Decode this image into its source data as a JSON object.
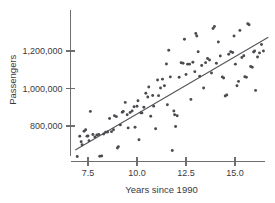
{
  "chart_data": {
    "type": "scatter",
    "title": "",
    "subtitle": "",
    "xlabel": "Years since 1990",
    "ylabel": "Passengers",
    "xlim": [
      6.8,
      16.8
    ],
    "ylim": [
      620000,
      1400000
    ],
    "grid": false,
    "legend": null,
    "xticks": [
      7.5,
      10.0,
      12.5,
      15.0
    ],
    "xtick_labels": [
      "7.5",
      "10.0",
      "12.5",
      "15.0"
    ],
    "yticks": [
      800000,
      1000000,
      1200000
    ],
    "ytick_labels": [
      "800,000",
      "1,000,000",
      "1,200,000"
    ],
    "point_color": "#4a4a50",
    "line_color": "#55555a",
    "axis_color": "#6f6f72",
    "trend_line": {
      "x_start": 6.85,
      "y_start": 672000,
      "x_end": 16.7,
      "y_end": 1273000
    },
    "series": [
      {
        "name": "Passengers",
        "points": [
          [
            6.95,
            637000
          ],
          [
            7.08,
            745000
          ],
          [
            7.15,
            716000
          ],
          [
            7.2,
            700000
          ],
          [
            7.3,
            772000
          ],
          [
            7.38,
            780000
          ],
          [
            7.45,
            746000
          ],
          [
            7.5,
            747000
          ],
          [
            7.55,
            722000
          ],
          [
            7.62,
            878000
          ],
          [
            7.75,
            755000
          ],
          [
            7.85,
            742000
          ],
          [
            7.95,
            752000
          ],
          [
            8.05,
            755000
          ],
          [
            8.1,
            639000
          ],
          [
            8.2,
            640000
          ],
          [
            8.3,
            757000
          ],
          [
            8.4,
            767000
          ],
          [
            8.5,
            768000
          ],
          [
            8.6,
            840000
          ],
          [
            8.7,
            770000
          ],
          [
            8.8,
            780000
          ],
          [
            8.85,
            855000
          ],
          [
            8.95,
            850000
          ],
          [
            9.0,
            683000
          ],
          [
            9.05,
            690000
          ],
          [
            9.15,
            806000
          ],
          [
            9.25,
            873000
          ],
          [
            9.3,
            878000
          ],
          [
            9.4,
            926000
          ],
          [
            9.5,
            860000
          ],
          [
            9.55,
            790000
          ],
          [
            9.65,
            872000
          ],
          [
            9.75,
            880000
          ],
          [
            9.85,
            903000
          ],
          [
            9.9,
            793000
          ],
          [
            10.0,
            905000
          ],
          [
            10.05,
            935000
          ],
          [
            10.1,
            727000
          ],
          [
            10.2,
            870000
          ],
          [
            10.25,
            870000
          ],
          [
            10.35,
            900000
          ],
          [
            10.45,
            975000
          ],
          [
            10.55,
            955000
          ],
          [
            10.6,
            1008000
          ],
          [
            10.7,
            852000
          ],
          [
            10.8,
            963000
          ],
          [
            10.85,
            906000
          ],
          [
            10.95,
            785000
          ],
          [
            11.05,
            1045000
          ],
          [
            11.1,
            962000
          ],
          [
            11.2,
            1003000
          ],
          [
            11.3,
            1050000
          ],
          [
            11.4,
            1015000
          ],
          [
            11.5,
            1131000
          ],
          [
            11.55,
            913000
          ],
          [
            11.62,
            1204000
          ],
          [
            11.7,
            1062000
          ],
          [
            11.8,
            669000
          ],
          [
            11.88,
            880000
          ],
          [
            11.92,
            860000
          ],
          [
            11.97,
            797000
          ],
          [
            12.05,
            855000
          ],
          [
            12.15,
            1060000
          ],
          [
            12.25,
            1137000
          ],
          [
            12.35,
            1135000
          ],
          [
            12.42,
            1263000
          ],
          [
            12.5,
            1075000
          ],
          [
            12.58,
            1130000
          ],
          [
            12.68,
            1130000
          ],
          [
            12.75,
            942000
          ],
          [
            12.85,
            1140000
          ],
          [
            12.95,
            1090000
          ],
          [
            13.0,
            1293000
          ],
          [
            13.05,
            1280000
          ],
          [
            13.12,
            1196000
          ],
          [
            13.2,
            1065000
          ],
          [
            13.3,
            1123000
          ],
          [
            13.4,
            1003000
          ],
          [
            13.5,
            1138000
          ],
          [
            13.6,
            1160000
          ],
          [
            13.7,
            1152000
          ],
          [
            13.8,
            1083000
          ],
          [
            13.88,
            1320000
          ],
          [
            13.95,
            1331000
          ],
          [
            14.05,
            1135000
          ],
          [
            14.15,
            1248000
          ],
          [
            14.25,
            1173000
          ],
          [
            14.35,
            1062000
          ],
          [
            14.42,
            1056000
          ],
          [
            14.5,
            960000
          ],
          [
            14.58,
            965000
          ],
          [
            14.68,
            1183000
          ],
          [
            14.78,
            1196000
          ],
          [
            14.88,
            1192000
          ],
          [
            14.95,
            1280000
          ],
          [
            15.02,
            1130000
          ],
          [
            15.1,
            1015000
          ],
          [
            15.18,
            1038000
          ],
          [
            15.25,
            1310000
          ],
          [
            15.35,
            1165000
          ],
          [
            15.45,
            1175000
          ],
          [
            15.5,
            1063000
          ],
          [
            15.58,
            1060000
          ],
          [
            15.65,
            1345000
          ],
          [
            15.72,
            1340000
          ],
          [
            15.8,
            1117000
          ],
          [
            15.88,
            1113000
          ],
          [
            15.95,
            1195000
          ],
          [
            16.0,
            1200000
          ],
          [
            16.05,
            990000
          ],
          [
            16.15,
            1168000
          ],
          [
            16.25,
            1190000
          ],
          [
            16.35,
            1235000
          ],
          [
            16.45,
            1200000
          ]
        ]
      }
    ]
  }
}
